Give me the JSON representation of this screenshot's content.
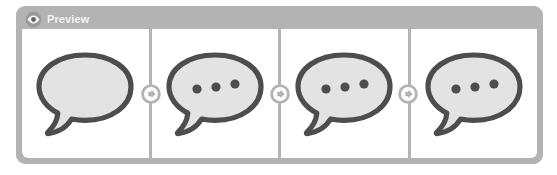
{
  "widget": {
    "name": "preview-panel",
    "header": {
      "title": "Preview",
      "icon": "eye-icon",
      "background_color": "#b3b3b3",
      "text_color": "#f2f2f2"
    },
    "frame": {
      "border_color": "#b3b3b3",
      "panel_background": "#ffffff",
      "divider_color": "#b3b3b3"
    }
  },
  "colors": {
    "bubble_outline": "#4d4d4d",
    "bubble_fill": "#e3e3e3",
    "dot_color": "#4d4d4d",
    "connector_color": "#b3b3b3",
    "connector_inner": "#ffffff"
  },
  "panels": [
    {
      "index": 1,
      "label": "frame-1",
      "icon": "speech-bubble-icon",
      "dots": 0,
      "state": "empty"
    },
    {
      "index": 2,
      "label": "frame-2",
      "icon": "speech-bubble-typing-icon",
      "dots": 3,
      "state": "typing"
    },
    {
      "index": 3,
      "label": "frame-3",
      "icon": "speech-bubble-typing-icon",
      "dots": 3,
      "state": "typing"
    },
    {
      "index": 4,
      "label": "frame-4",
      "icon": "speech-bubble-typing-icon",
      "dots": 3,
      "state": "typing"
    }
  ],
  "connectors": [
    {
      "index": 1,
      "icon": "arrow-right-circle-icon",
      "between": "frame-1-frame-2"
    },
    {
      "index": 2,
      "icon": "arrow-right-circle-icon",
      "between": "frame-2-frame-3"
    },
    {
      "index": 3,
      "icon": "arrow-right-circle-icon",
      "between": "frame-3-frame-4"
    }
  ]
}
